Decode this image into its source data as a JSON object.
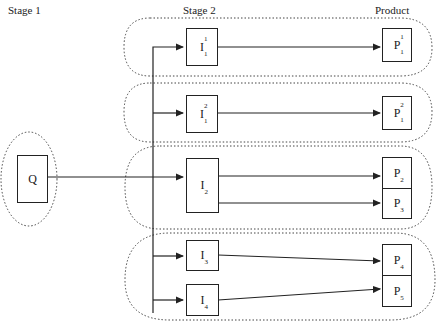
{
  "headers": {
    "stage1": "Stage 1",
    "stage2": "Stage 2",
    "product": "Product"
  },
  "source": {
    "label": "Q"
  },
  "intermediates": [
    {
      "id": "I1_1",
      "base": "I",
      "sub": "1",
      "sup": "1"
    },
    {
      "id": "I1_2",
      "base": "I",
      "sub": "1",
      "sup": "2"
    },
    {
      "id": "I2",
      "base": "I",
      "sub": "2",
      "sup": ""
    },
    {
      "id": "I3",
      "base": "I",
      "sub": "3",
      "sup": ""
    },
    {
      "id": "I4",
      "base": "I",
      "sub": "4",
      "sup": ""
    }
  ],
  "products": [
    {
      "id": "P1_1",
      "base": "P",
      "sub": "1",
      "sup": "1"
    },
    {
      "id": "P1_2",
      "base": "P",
      "sub": "1",
      "sup": "2"
    },
    {
      "id": "P2",
      "base": "P",
      "sub": "2",
      "sup": ""
    },
    {
      "id": "P3",
      "base": "P",
      "sub": "3",
      "sup": ""
    },
    {
      "id": "P4",
      "base": "P",
      "sub": "4",
      "sup": ""
    },
    {
      "id": "P5",
      "base": "P",
      "sub": "5",
      "sup": ""
    }
  ],
  "edges": [
    {
      "from": "Q",
      "to": "I1_1"
    },
    {
      "from": "Q",
      "to": "I1_2"
    },
    {
      "from": "Q",
      "to": "I2"
    },
    {
      "from": "Q",
      "to": "I3"
    },
    {
      "from": "Q",
      "to": "I4"
    },
    {
      "from": "I1_1",
      "to": "P1_1"
    },
    {
      "from": "I1_2",
      "to": "P1_2"
    },
    {
      "from": "I2",
      "to": "P2"
    },
    {
      "from": "I2",
      "to": "P3"
    },
    {
      "from": "I3",
      "to": "P4"
    },
    {
      "from": "I4",
      "to": "P5"
    }
  ],
  "groups": [
    {
      "name": "group-1",
      "members": [
        "I1_1",
        "P1_1"
      ]
    },
    {
      "name": "group-2",
      "members": [
        "I1_2",
        "P1_2"
      ]
    },
    {
      "name": "group-3",
      "members": [
        "I2",
        "P2",
        "P3"
      ]
    },
    {
      "name": "group-4",
      "members": [
        "I3",
        "I4",
        "P4",
        "P5"
      ]
    },
    {
      "name": "group-source",
      "members": [
        "Q"
      ]
    }
  ]
}
